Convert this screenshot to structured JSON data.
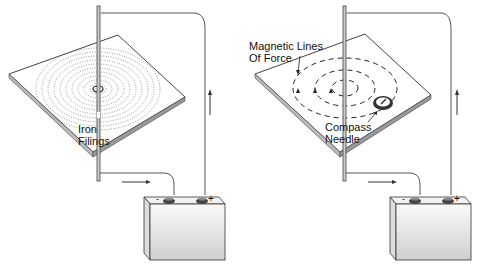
{
  "panels": [
    {
      "id": "left",
      "title": "",
      "labels": [
        {
          "text": "Iron",
          "x": 78,
          "y": 123
        },
        {
          "text": "Filings",
          "x": 78,
          "y": 135
        }
      ],
      "battery": {
        "neg": "-",
        "pos": "+"
      }
    },
    {
      "id": "right",
      "labels": [
        {
          "text": "Magnetic Lines",
          "x": 249,
          "y": 40
        },
        {
          "text": "Of Force",
          "x": 249,
          "y": 52
        },
        {
          "text": "Compass",
          "x": 325,
          "y": 121
        },
        {
          "text": "Needle",
          "x": 325,
          "y": 133
        }
      ],
      "battery": {
        "neg": "-",
        "pos": "+"
      }
    }
  ],
  "colors": {
    "line": "#333333",
    "plate_edge": "#555555",
    "battery_fill": "#e6e6e6"
  }
}
